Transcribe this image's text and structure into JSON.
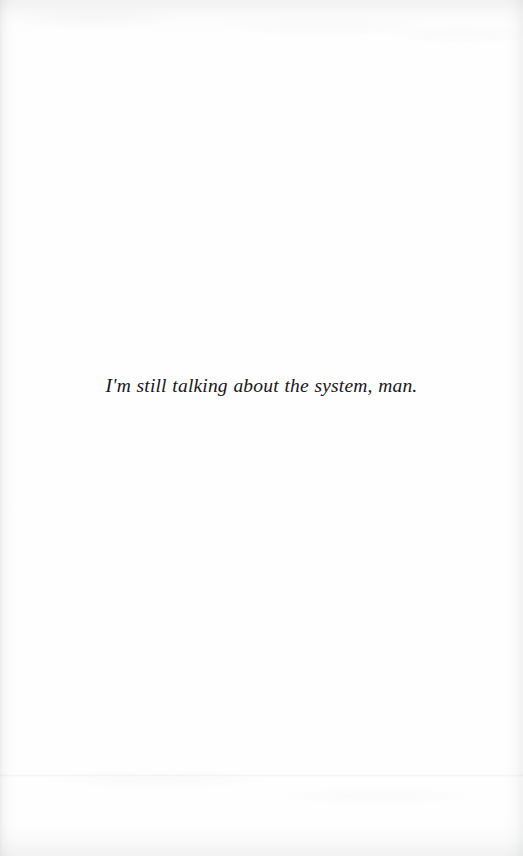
{
  "page": {
    "kind": "scanned-book-page",
    "width": 523,
    "height": 856,
    "background_color": "#fefefe",
    "ink_color": "#17171a",
    "scan_edge_tint": "#9ea0a4"
  },
  "content": {
    "epigraph": {
      "text": "I'm still talking about the system, man.",
      "style": "italic",
      "alignment": "center"
    }
  }
}
